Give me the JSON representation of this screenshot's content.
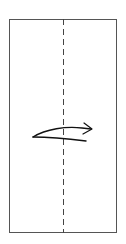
{
  "figure": {
    "background_color": "#ffffff",
    "width": 126,
    "height": 244
  },
  "sheet": {
    "label": "paper-sheet",
    "shape": "rectangle",
    "x": 9,
    "y": 19,
    "width": 108,
    "height": 214,
    "fill_color": "#ffffff",
    "stroke_color": "#555555",
    "stroke_width": 1
  },
  "fold_line": {
    "label": "vertical-center-fold-line",
    "orientation": "vertical",
    "x": 63,
    "y_start": 19,
    "y_end": 233,
    "style": "dashed",
    "dash_length": 6,
    "gap_length": 4,
    "stroke_color": "#444444",
    "stroke_width": 1
  },
  "fold_arrow": {
    "label": "fold-right-arrow",
    "direction": "right",
    "meaning": "valley fold: fold left half over to the right across the center line",
    "tail_x": 33,
    "tail_y": 137,
    "tip_x": 92,
    "tip_y": 129,
    "upper_curve_path": "M33,137 C46,129 66,126 82,128 L91,129",
    "lower_curve_path": "M33,137 C48,137 70,139 86,141",
    "head_upper_path": "M84,123 L92,129",
    "head_lower_path": "M83,134 L92,129",
    "stroke_color": "#111111",
    "stroke_width": 1.4,
    "head_stroke_width": 1.2
  },
  "captions": []
}
